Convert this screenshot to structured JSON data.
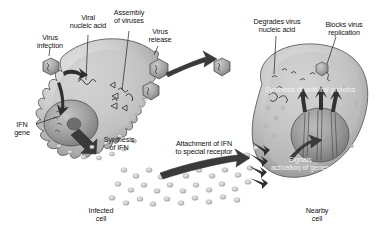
{
  "figure": {
    "type": "biology-diagram",
    "background_color": "#ffffff",
    "palette": {
      "cell_fill_light": "#d9d9d9",
      "cell_fill_mid": "#b5b5b5",
      "cell_fill_dark": "#8f8f8f",
      "nucleus_fill": "#9a9a9a",
      "outline": "#4a4a4a",
      "arrow_dark": "#3c3c3c",
      "virus_fill": "#a8a8a8",
      "ifn_particle": "#cfcfcf",
      "text_dark": "#1b1b1b",
      "text_light": "#f2f2f2"
    }
  },
  "labels": {
    "virus_infection": "Virus\ninfection",
    "viral_nucleic_acid": "Viral\nnucleic acid",
    "assembly_of_viruses": "Assembly\nof viruses",
    "virus_release": "Virus\nrelease",
    "degrades_virus_nucleic_acid": "Degrades virus\nnucleic acid",
    "blocks_virus_replication": "Blocks virus\nreplication",
    "synthesis_of_antiviral_proteins": "Synthesis of antiviral proteins",
    "ifn_gene": "IFN\ngene",
    "synthesis_of_ifn": "Synthesis\nof IFN",
    "attachment_of_ifn": "Attachment of IFN\nto special receptor",
    "signals_activation_of_genes": "Signals\nactivation of genes",
    "infected_cell": "Infected\ncell",
    "nearby_cell": "Nearby\ncell"
  },
  "elements": {
    "infected_cell_name": "infected-cell-body",
    "nearby_cell_name": "nearby-cell-body",
    "infected_nucleus_name": "infected-cell-nucleus",
    "nearby_nucleus_name": "nearby-cell-nucleus",
    "virus_particles_count": 5,
    "ifn_particles_count": 34,
    "receptor_arrow_count": 4,
    "antiviral_protein_arrow_count": 3
  }
}
